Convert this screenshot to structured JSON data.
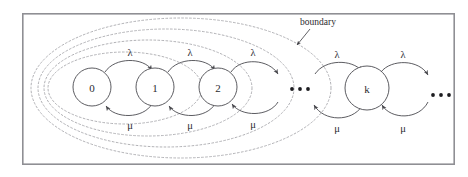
{
  "figure": {
    "frame": {
      "x": 22,
      "y": 13,
      "width": 433,
      "height": 152,
      "border_color": "#8f8f94"
    },
    "annotation": {
      "label": "boundary",
      "label_x": 318,
      "label_y": 22,
      "pointer_from_x": 310,
      "pointer_from_y": 29,
      "pointer_to_x": 296,
      "pointer_to_y": 46
    },
    "states": [
      {
        "id": "s0",
        "label": "0",
        "cx": 92,
        "cy": 87,
        "r": 19
      },
      {
        "id": "s1",
        "label": "1",
        "cx": 155,
        "cy": 87,
        "r": 19
      },
      {
        "id": "s2",
        "label": "2",
        "cx": 218,
        "cy": 87,
        "r": 19
      },
      {
        "id": "sk",
        "label": "k",
        "cx": 367,
        "cy": 88,
        "r": 22
      }
    ],
    "ellipses_groups": [
      {
        "id": "gap-ellipsis",
        "cx": 300,
        "cy": 89,
        "dot_count": 3,
        "dot_spacing": 8,
        "dot_radius": 1.9
      },
      {
        "id": "tail-ellipsis",
        "cx": 441,
        "cy": 95,
        "dot_count": 3,
        "dot_spacing": 8,
        "dot_radius": 1.9
      }
    ],
    "forward_rate_symbol": "λ",
    "backward_rate_symbol": "μ",
    "forward_labels": [
      {
        "text": "λ",
        "x": 130,
        "y": 52
      },
      {
        "text": "λ",
        "x": 190,
        "y": 52
      },
      {
        "text": "λ",
        "x": 253,
        "y": 52
      },
      {
        "text": "λ",
        "x": 337,
        "y": 54
      },
      {
        "text": "λ",
        "x": 403,
        "y": 54
      }
    ],
    "backward_labels": [
      {
        "text": "μ",
        "x": 130,
        "y": 125
      },
      {
        "text": "μ",
        "x": 190,
        "y": 125
      },
      {
        "text": "μ",
        "x": 253,
        "y": 124
      },
      {
        "text": "μ",
        "x": 337,
        "y": 128
      },
      {
        "text": "μ",
        "x": 403,
        "y": 128
      }
    ],
    "boundary_ellipses": [
      {
        "cx": 181,
        "cy": 88,
        "rx": 150,
        "ry": 70
      },
      {
        "cx": 166,
        "cy": 88,
        "rx": 128,
        "ry": 59
      },
      {
        "cx": 148,
        "cy": 88,
        "rx": 104,
        "ry": 48
      },
      {
        "cx": 125,
        "cy": 88,
        "rx": 77,
        "ry": 36
      }
    ],
    "colors": {
      "frame_border": "#8f8f94",
      "state_stroke": "#4a4a4f",
      "arc_stroke": "#4a4a4f",
      "boundary_stroke": "#a8a8ad",
      "text": "#2b2b2f",
      "background": "#ffffff"
    }
  }
}
